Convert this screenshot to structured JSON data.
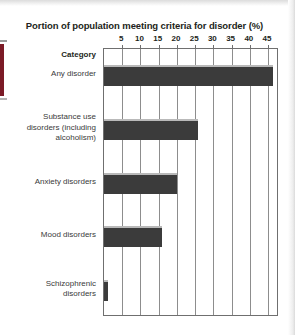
{
  "page": {
    "background_color": "#ffffff",
    "spine_color": "#7b1a26"
  },
  "axis_header": {
    "category_label": "Category"
  },
  "chart_data": {
    "type": "bar",
    "orientation": "horizontal",
    "title": "Portion of population meeting criteria for disorder (%)",
    "xlabel": "",
    "ylabel": "Category",
    "xlim": [
      0,
      48
    ],
    "xticks": [
      5,
      10,
      15,
      20,
      25,
      30,
      35,
      40,
      45
    ],
    "xtick_labels": [
      "5",
      "10",
      "15",
      "20",
      "25",
      "30",
      "35",
      "40",
      "45"
    ],
    "grid": true,
    "legend": "none",
    "bar_color": "#3b3b3b",
    "categories": [
      "Any disorder",
      "Substance use\ndisorders (including\nalcoholism)",
      "Anxiety disorders",
      "Mood disorders",
      "Schizophrenic\ndisorders"
    ],
    "values": [
      46.4,
      25.7,
      20.0,
      16.0,
      1.0
    ]
  }
}
